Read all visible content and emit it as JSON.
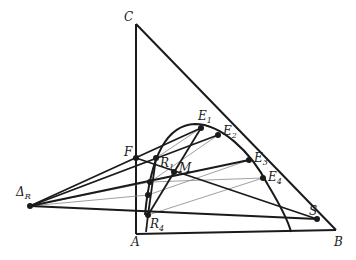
{
  "diagram": {
    "labels": {
      "C": "C",
      "A": "A",
      "B": "B",
      "F": "F",
      "M": "M",
      "S": "S",
      "E1": "E",
      "E1_sub": "1",
      "E2": "E",
      "E2_sub": "2",
      "E3": "E",
      "E3_sub": "3",
      "E4": "E",
      "E4_sub": "4",
      "R1": "R",
      "R1_sub": "1",
      "R4": "R",
      "R4_sub": "4",
      "DeltaR": "Δ",
      "DeltaR_sub": "R"
    },
    "colors": {
      "stroke": "#1a1a1a",
      "thin": "#888888",
      "background": "#ffffff"
    }
  }
}
